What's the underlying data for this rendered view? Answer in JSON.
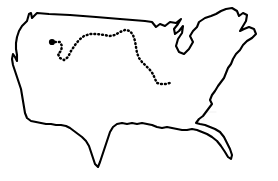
{
  "figure": {
    "kind": "map",
    "background_color": "#ffffff",
    "width": 278,
    "height": 181
  },
  "map": {
    "region_name": "Contiguous United States",
    "outline_color": "#000000",
    "outline_width": 2.1,
    "fill_color": "#ffffff",
    "state_border_color": "#eeeeee",
    "state_border_width": 0.85,
    "country_outline_path": "M 27 21 L 29 14 L 31 13 L 32 18 L 35 15 L 37 13 L 49 14 L 70 15 L 96 17 L 120 19 L 145 21 L 152 22 L 156 27 L 160 24 L 165 26 L 170 22 L 176 23 L 181 19 L 178 24 L 174 29 L 175 34 L 179 31 L 183 26 L 182 33 L 178 39 L 176 46 L 179 52 L 184 54 L 189 49 L 193 42 L 190 36 L 193 31 L 197 27 L 199 22 L 205 18 L 211 16 L 216 14 L 221 11 L 226 9 L 232 8 L 237 11 L 239 16 L 243 13 L 247 15 L 246 21 L 243 26 L 240 31 L 244 29 L 249 27 L 254 29 L 256 34 L 252 38 L 247 41 L 243 45 L 240 50 L 236 54 L 233 59 L 231 64 L 228 68 L 226 73 L 224 78 L 221 82 L 218 86 L 215 91 L 212 95 L 210 100 L 212 104 L 209 108 L 206 112 L 203 116 L 199 119 L 196 123 L 200 124 L 205 125 L 210 127 L 215 129 L 220 132 L 224 137 L 227 143 L 230 149 L 232 155 L 231 159 L 228 157 L 225 152 L 221 146 L 217 141 L 212 137 L 207 134 L 202 132 L 197 130 L 192 129 L 187 130 L 182 130 L 177 129 L 172 128 L 167 127 L 162 128 L 157 127 L 152 125 L 147 124 L 142 123 L 137 124 L 132 123 L 127 124 L 122 123 L 117 124 L 113 127 L 110 132 L 108 138 L 106 144 L 104 150 L 102 156 L 100 162 L 98 167 L 95 164 L 93 158 L 91 152 L 89 146 L 86 141 L 82 137 L 78 134 L 74 131 L 70 128 L 66 126 L 61 125 L 56 125 L 51 124 L 46 124 L 41 123 L 36 122 L 31 121 L 27 118 L 25 113 L 24 107 L 23 101 L 22 95 L 21 89 L 19 83 L 17 77 L 15 71 L 13 65 L 12 59 L 13 54 L 15 57 L 17 61 L 17 55 L 16 49 L 16 43 L 17 37 L 19 31 L 22 26 Z",
    "state_borders": [
      "M 29 44 L 60 47 L 62 52 L 96 55 L 98 57",
      "M 30 62 L 61 64 L 62 67",
      "M 24 78 L 48 79 L 50 82",
      "M 49 47 L 50 79",
      "M 61 47 L 62 80",
      "M 62 80 L 96 82",
      "M 96 55 L 97 118",
      "M 75 55 L 76 82",
      "M 76 82 L 77 118",
      "M 62 82 L 63 106",
      "M 40 80 L 41 112",
      "M 112 21 L 113 55",
      "M 130 22 L 131 56",
      "M 113 40 L 131 41",
      "M 97 60 L 131 62",
      "M 97 78 L 132 80",
      "M 97 96 L 135 98",
      "M 112 98 L 113 124",
      "M 131 56 L 151 57",
      "M 146 27 L 150 57",
      "M 131 62 L 152 63",
      "M 132 80 L 158 82",
      "M 135 98 L 165 100",
      "M 151 57 L 153 82",
      "M 153 82 L 155 100",
      "M 165 100 L 168 126",
      "M 147 100 L 149 127",
      "M 165 66 L 192 68",
      "M 168 82 L 196 84",
      "M 170 57 L 192 58",
      "M 178 58 L 179 84",
      "M 186 58 L 188 84",
      "M 168 100 L 200 102",
      "M 182 102 L 184 128",
      "M 196 84 L 198 102",
      "M 200 102 L 204 120",
      "M 202 112 L 216 112",
      "M 196 62 L 212 62",
      "M 204 58 L 206 72",
      "M 210 48 L 212 58",
      "M 216 44 L 218 52",
      "M 222 38 L 226 42",
      "M 229 28 L 234 32"
    ]
  },
  "route": {
    "name": "dotted-travel-route",
    "style": "dotted",
    "color": "#000000",
    "stroke_width": 2.5,
    "dash_pattern": "0.8 3.1",
    "path": "M 55 42 L 60 42 L 62 46 L 61 51 L 58 54 L 60 58 L 64 60 L 68 57 L 71 51 L 75 45 L 79 40 L 84 36 L 90 34 L 97 34 L 104 35 L 110 36 L 115 35 L 120 32 L 125 30 L 130 31 L 133 35 L 135 41 L 136 47 L 137 53 L 139 58 L 142 62 L 146 66 L 150 70 L 153 74 L 155 79 L 157 83 L 161 84 L 166 84 L 170 83"
  },
  "marker": {
    "name": "origin-point-marker",
    "color": "#000000",
    "x": 52,
    "y": 42,
    "radius": 3.1
  },
  "chart_data": {
    "type": "map",
    "series": [
      {
        "name": "country-outline",
        "geometry": "polygon",
        "color": "#000000"
      },
      {
        "name": "state-boundaries",
        "geometry": "polylines",
        "color": "#eeeeee"
      },
      {
        "name": "dotted-route",
        "geometry": "dotted-polyline",
        "color": "#000000",
        "start_point": [
          55,
          42
        ],
        "end_point": [
          170,
          83
        ]
      },
      {
        "name": "point-marker",
        "geometry": "point",
        "color": "#000000",
        "point": [
          52,
          42
        ]
      }
    ],
    "xlim": [
      0,
      278
    ],
    "ylim": [
      0,
      181
    ],
    "grid": false,
    "legend": "none",
    "axis_labels": {
      "xlabel": "",
      "ylabel": ""
    },
    "tick_labels": {
      "x": [],
      "y": []
    },
    "annotations": []
  }
}
